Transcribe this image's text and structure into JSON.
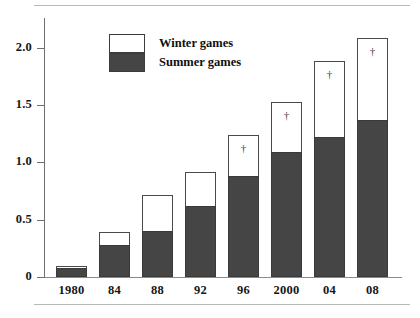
{
  "chart_data": {
    "type": "bar",
    "subtype": "stacked-bar",
    "title": "",
    "xlabel": "",
    "ylabel": "",
    "ylim": [
      0,
      2.2
    ],
    "grid": false,
    "legend_position": "top-left",
    "categories": [
      "1980",
      "84",
      "88",
      "92",
      "96",
      "2000",
      "04",
      "08"
    ],
    "series": [
      {
        "name": "Summer games",
        "color": "#454545",
        "values": [
          0.08,
          0.28,
          0.4,
          0.62,
          0.88,
          1.09,
          1.22,
          1.37
        ]
      },
      {
        "name": "Winter games",
        "color": "#ffffff",
        "values": [
          0.02,
          0.11,
          0.32,
          0.3,
          0.36,
          0.44,
          0.67,
          0.72
        ]
      }
    ],
    "totals": [
      0.1,
      0.39,
      0.72,
      0.92,
      1.24,
      1.53,
      1.89,
      2.09
    ],
    "annotations": [
      {
        "category": "96",
        "marker": "†"
      },
      {
        "category": "2000",
        "marker": "†"
      },
      {
        "category": "04",
        "marker": "†"
      },
      {
        "category": "08",
        "marker": "†"
      }
    ],
    "yticks": [
      {
        "value": 0,
        "label": "0"
      },
      {
        "value": 0.5,
        "label": "0.5"
      },
      {
        "value": 1.0,
        "label": "1.0"
      },
      {
        "value": 1.5,
        "label": "1.5"
      },
      {
        "value": 2.0,
        "label": "2.0"
      }
    ]
  },
  "legend": {
    "items": [
      {
        "label": "Winter games",
        "key": "winter"
      },
      {
        "label": "Summer games",
        "key": "summer"
      }
    ]
  },
  "colors": {
    "summer_fill": "#454545",
    "winter_fill": "#ffffff",
    "axis": "#6f6f6f",
    "text": "#161616"
  }
}
